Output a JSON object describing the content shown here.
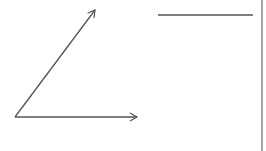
{
  "diagram": {
    "type": "vector-angle-sketch",
    "stroke_color": "#555555",
    "border_color": "#888888",
    "elements": [
      {
        "name": "diagonal-arrow",
        "x1": 15,
        "y1": 117,
        "x2": 95,
        "y2": 10,
        "arrowhead": true
      },
      {
        "name": "horizontal-arrow",
        "x1": 15,
        "y1": 117,
        "x2": 137,
        "y2": 117,
        "arrowhead": true
      },
      {
        "name": "horizontal-line",
        "x1": 158,
        "y1": 15,
        "x2": 253,
        "y2": 15,
        "arrowhead": false
      },
      {
        "name": "right-border-line",
        "x1": 262,
        "y1": 0,
        "x2": 262,
        "y2": 151,
        "arrowhead": false
      }
    ]
  }
}
